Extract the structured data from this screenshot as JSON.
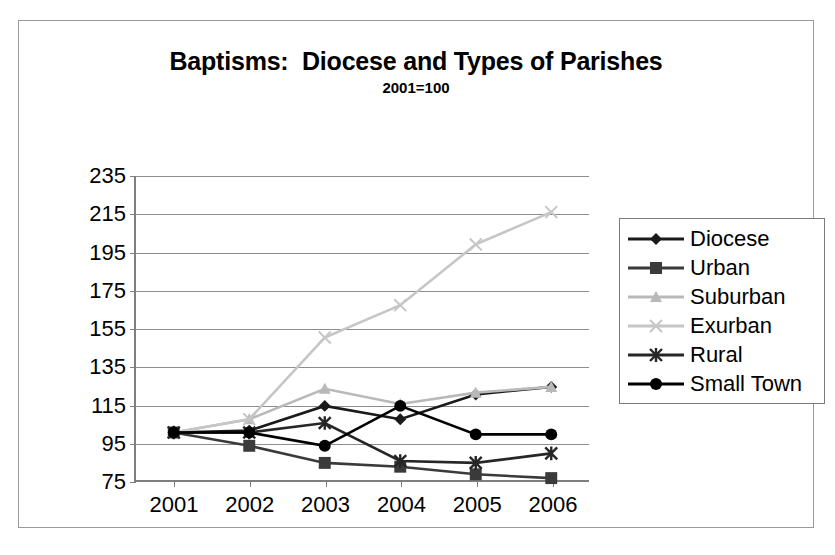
{
  "chart_data": {
    "type": "line",
    "title": "Baptisms:  Diocese and Types of Parishes",
    "subtitle": "2001=100",
    "xlabel": "",
    "ylabel": "",
    "categories": [
      "2001",
      "2002",
      "2003",
      "2004",
      "2005",
      "2006"
    ],
    "x_ticks": [
      "2001",
      "2002",
      "2003",
      "2004",
      "2005",
      "2006"
    ],
    "y_ticks": [
      75,
      95,
      115,
      135,
      155,
      175,
      195,
      215,
      235
    ],
    "ylim": [
      75,
      235
    ],
    "grid": true,
    "legend_position": "right",
    "series": [
      {
        "name": "Diocese",
        "marker": "diamond",
        "color": "#1a1a1a",
        "values": [
          100,
          101,
          114,
          107,
          120,
          124
        ]
      },
      {
        "name": "Urban",
        "marker": "square",
        "color": "#3a3a3a",
        "values": [
          100,
          93,
          84,
          82,
          78,
          76
        ]
      },
      {
        "name": "Suburban",
        "marker": "triangle",
        "color": "#b9b9b9",
        "values": [
          100,
          107,
          123,
          115,
          121,
          124
        ]
      },
      {
        "name": "Exurban",
        "marker": "x",
        "color": "#c6c6c6",
        "values": [
          100,
          107,
          150,
          167,
          199,
          216
        ]
      },
      {
        "name": "Rural",
        "marker": "asterisk",
        "color": "#262626",
        "values": [
          100,
          100,
          105,
          85,
          84,
          89
        ]
      },
      {
        "name": "Small Town",
        "marker": "circle",
        "color": "#000000",
        "values": [
          100,
          100,
          93,
          114,
          99,
          99
        ]
      }
    ]
  }
}
